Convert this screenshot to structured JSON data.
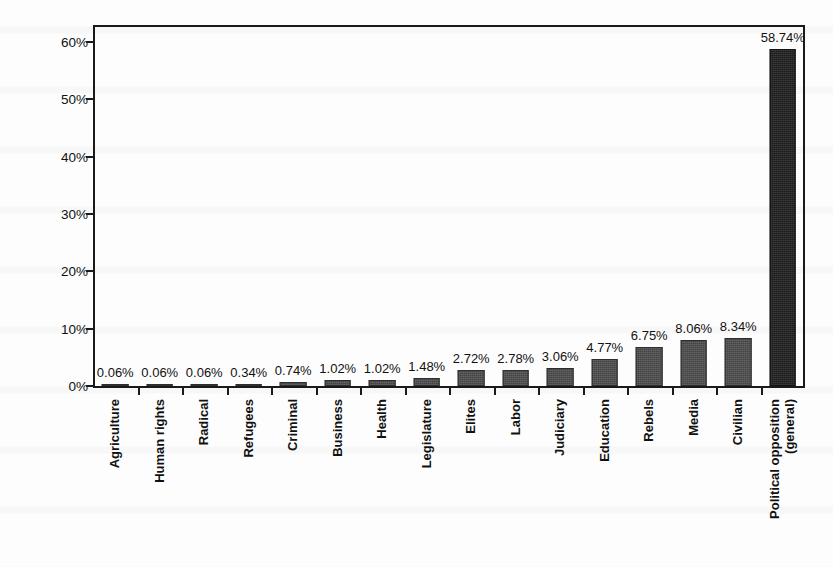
{
  "chart_data": {
    "type": "bar",
    "title": "",
    "xlabel": "",
    "ylabel": "Percentage of total number of records",
    "ylim": [
      0,
      63
    ],
    "ytick_values": [
      0,
      10,
      20,
      30,
      40,
      50,
      60
    ],
    "ytick_labels": [
      "0%",
      "10%",
      "20%",
      "30%",
      "40%",
      "50%",
      "60%"
    ],
    "grid": false,
    "legend": "none",
    "bar_color": "#4d4d4d",
    "highlight_color": "#1f1f1f",
    "categories": [
      "Agriculture",
      "Human rights",
      "Radical",
      "Refugees",
      "Criminal",
      "Business",
      "Health",
      "Legislature",
      "Elites",
      "Labor",
      "Judiciary",
      "Education",
      "Rebels",
      "Media",
      "Civilian",
      "Political opposition (general)"
    ],
    "category_lines": [
      [
        "Agriculture"
      ],
      [
        "Human rights"
      ],
      [
        "Radical"
      ],
      [
        "Refugees"
      ],
      [
        "Criminal"
      ],
      [
        "Business"
      ],
      [
        "Health"
      ],
      [
        "Legislature"
      ],
      [
        "Elites"
      ],
      [
        "Labor"
      ],
      [
        "Judiciary"
      ],
      [
        "Education"
      ],
      [
        "Rebels"
      ],
      [
        "Media"
      ],
      [
        "Civilian"
      ],
      [
        "Political opposition",
        "(general)"
      ]
    ],
    "values": [
      0.06,
      0.06,
      0.06,
      0.34,
      0.74,
      1.02,
      1.02,
      1.48,
      2.72,
      2.78,
      3.06,
      4.77,
      6.75,
      8.06,
      8.34,
      58.74
    ],
    "value_labels": [
      "0.06%",
      "0.06%",
      "0.06%",
      "0.34%",
      "0.74%",
      "1.02%",
      "1.02%",
      "1.48%",
      "2.72%",
      "2.78%",
      "3.06%",
      "4.77%",
      "6.75%",
      "8.06%",
      "8.34%",
      "58.74%"
    ],
    "highlight_index": 15
  }
}
